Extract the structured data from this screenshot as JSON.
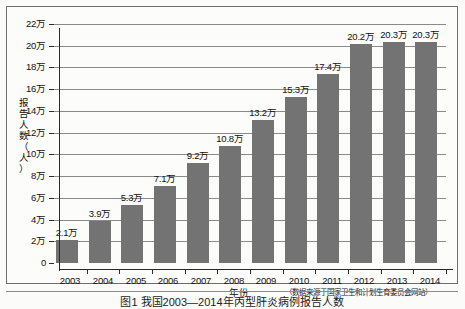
{
  "chart_data": {
    "type": "bar",
    "title": "",
    "categories": [
      "2003",
      "2004",
      "2005",
      "2006",
      "2007",
      "2008",
      "2009",
      "2010",
      "2011",
      "2012",
      "2013",
      "2014"
    ],
    "values": [
      2.1,
      3.9,
      5.3,
      7.1,
      9.2,
      10.8,
      13.2,
      15.3,
      17.4,
      20.2,
      20.3,
      20.3
    ],
    "value_labels": [
      "2.1万",
      "3.9万",
      "5.3万",
      "7.1万",
      "9.2万",
      "10.8万",
      "13.2万",
      "15.3万",
      "17.4万",
      "20.2万",
      "20.3万",
      "20.3万"
    ],
    "xlabel": "年份",
    "ylabel": "报告人数（人）",
    "ylim": [
      0,
      22
    ],
    "ytick_values": [
      0,
      2,
      4,
      6,
      8,
      10,
      12,
      14,
      16,
      18,
      20,
      22
    ],
    "ytick_labels": [
      "0",
      "2万",
      "4万",
      "6万",
      "8万",
      "10万",
      "12万",
      "14万",
      "16万",
      "18万",
      "20万",
      "22万"
    ],
    "unit_note": "万 = 10,000 persons",
    "grid": true,
    "legend": "none",
    "bar_color": "#737373",
    "axis_color": "#2b2b2b",
    "grid_color": "#8a8a8a",
    "background_color": "#fcfcfb"
  },
  "annotations": {
    "source_note": "（数据来源于国家卫生和计划生育委员会网站）",
    "y_axis_title_chars": [
      "报",
      "告",
      "人",
      "数",
      "（",
      "人",
      "）"
    ]
  },
  "caption": {
    "text": "图1  我国2003—2014年丙型肝炎病例报告人数"
  }
}
